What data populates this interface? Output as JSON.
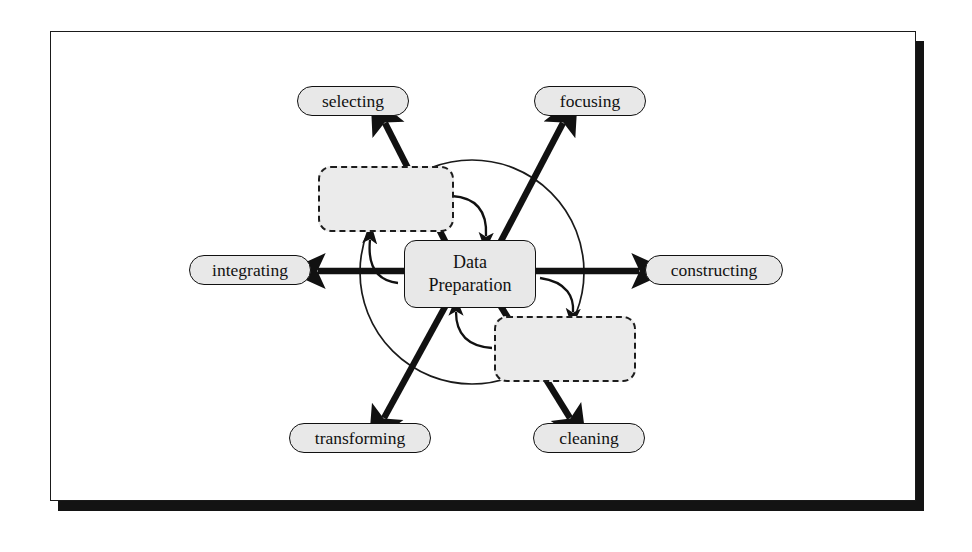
{
  "figure": {
    "background_color": "#ffffff",
    "panel_border_color": "#1a1a1a",
    "shadow_color": "#131313",
    "node_fill": "#e8e8e8",
    "dashed_node_fill": "#ebebeb",
    "stroke_color": "#111111"
  },
  "diagram": {
    "type": "radial-process-diagram",
    "center_node": {
      "id": "data-preparation",
      "line1": "Data",
      "line2": "Preparation",
      "shape": "rounded-rectangle",
      "border": "solid"
    },
    "spoke_nodes": [
      {
        "id": "selecting",
        "label": "selecting",
        "position": "top-left",
        "shape": "pill",
        "border": "solid"
      },
      {
        "id": "focusing",
        "label": "focusing",
        "position": "top-right",
        "shape": "pill",
        "border": "solid"
      },
      {
        "id": "integrating",
        "label": "integrating",
        "position": "left",
        "shape": "pill",
        "border": "solid"
      },
      {
        "id": "constructing",
        "label": "constructing",
        "position": "right",
        "shape": "pill",
        "border": "solid"
      },
      {
        "id": "transforming",
        "label": "transforming",
        "position": "bottom-left",
        "shape": "pill",
        "border": "solid"
      },
      {
        "id": "cleaning",
        "label": "cleaning",
        "position": "bottom-right",
        "shape": "pill",
        "border": "solid"
      }
    ],
    "dashed_nodes": [
      {
        "id": "dashed-upper",
        "label": "",
        "position": "upper-left-of-center",
        "shape": "rounded-rectangle",
        "border": "dashed"
      },
      {
        "id": "dashed-lower",
        "label": "",
        "position": "lower-right-of-center",
        "shape": "rounded-rectangle",
        "border": "dashed"
      }
    ],
    "encircling_ring": {
      "shape": "circle",
      "stroke": "thin",
      "center_x": 472,
      "center_y": 272,
      "radius": 112
    },
    "edges": [
      {
        "from": "data-preparation",
        "to": "selecting",
        "style": "thick-straight",
        "arrow": "single"
      },
      {
        "from": "data-preparation",
        "to": "focusing",
        "style": "thick-straight",
        "arrow": "single"
      },
      {
        "from": "data-preparation",
        "to": "integrating",
        "style": "thick-straight",
        "arrow": "single"
      },
      {
        "from": "data-preparation",
        "to": "constructing",
        "style": "thick-straight",
        "arrow": "single"
      },
      {
        "from": "data-preparation",
        "to": "transforming",
        "style": "thick-straight",
        "arrow": "single"
      },
      {
        "from": "data-preparation",
        "to": "cleaning",
        "style": "thick-straight",
        "arrow": "single"
      },
      {
        "from": "dashed-upper",
        "to": "data-preparation",
        "style": "thin-curved",
        "arrow": "single"
      },
      {
        "from": "data-preparation",
        "to": "dashed-lower",
        "style": "thin-curved",
        "arrow": "single"
      },
      {
        "from": "dashed-lower",
        "to": "data-preparation",
        "style": "thin-curved",
        "arrow": "single"
      },
      {
        "from": "data-preparation",
        "to": "dashed-upper",
        "style": "thin-curved",
        "arrow": "single"
      }
    ]
  },
  "page_bleed_lines": [
    "the data mining process and the steps that precede it, of",
    "which data preparation is the most demanding in terms of",
    "effort and of the overall elapsed time of a project.",
    "",
    "Figure 2.3 illustrates the iterative nature of the data",
    "preparation phase. The tasks are not performed in a strict",
    "sequence; rather, the analyst moves back and forth among",
    "them as understanding of the data improves. Each of the",
    "six sub-tasks may be revisited many times before the",
    "modelling phase can properly begin, and discoveries made",
    "during modelling frequently send the analyst back into",
    "data preparation once again.",
    "",
    "In practice the boundary between data preparation and",
    "modelling is blurred, since many modelling techniques",
    "require their own particular data representations and"
  ]
}
